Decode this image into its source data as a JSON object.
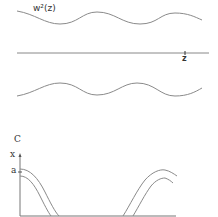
{
  "panel_top": {
    "function_label": "w²(z)",
    "axis_label": "z"
  },
  "panel_c": {
    "panel_letter": "C",
    "y_axis_label": "x",
    "y_tick_label": "a"
  },
  "colors": {
    "stroke": "#8a8a8a",
    "axis": "#777777",
    "text": "#333333"
  }
}
